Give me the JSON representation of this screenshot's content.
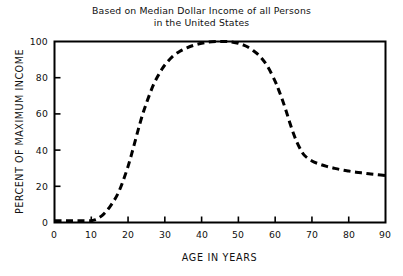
{
  "chart_data": {
    "type": "line",
    "title": "Based on Median Dollar Income of all Persons in the United States",
    "title_lines": [
      "Based on Median Dollar Income of all Persons",
      "in the United States"
    ],
    "xlabel": "AGE IN YEARS",
    "ylabel": "PERCENT OF MAXIMUM INCOME",
    "xlim": [
      0,
      90
    ],
    "ylim": [
      0,
      100
    ],
    "xticks": [
      0,
      10,
      20,
      30,
      40,
      50,
      60,
      70,
      80,
      90
    ],
    "yticks": [
      0,
      20,
      40,
      60,
      80,
      100
    ],
    "xtick_labels": [
      "0",
      "10",
      "20",
      "30",
      "40",
      "50",
      "60",
      "70",
      "80",
      "90"
    ],
    "ytick_labels": [
      "0",
      "20",
      "40",
      "60",
      "80",
      "100"
    ],
    "grid": false,
    "legend": null,
    "line_style": "dashed",
    "line_color": "#000000",
    "frame_color": "#000000",
    "background_color": "#ffffff",
    "series": [
      {
        "name": "Percent of maximum income",
        "x": [
          0,
          2,
          4,
          6,
          8,
          10,
          11,
          12,
          13,
          14,
          15,
          16,
          17,
          18,
          19,
          20,
          21,
          22,
          23,
          24,
          25,
          26,
          27,
          28,
          29,
          30,
          32,
          34,
          36,
          38,
          40,
          42,
          44,
          45,
          46,
          47,
          48,
          50,
          52,
          54,
          56,
          58,
          60,
          61,
          62,
          63,
          64,
          65,
          66,
          67,
          68,
          70,
          72,
          74,
          76,
          78,
          80,
          82,
          84,
          86,
          88,
          90
        ],
        "y": [
          1,
          1,
          1,
          1,
          1,
          1,
          1.5,
          2.5,
          4,
          6,
          8.5,
          11.5,
          15,
          19.5,
          25,
          31,
          38,
          45.5,
          53,
          60,
          66,
          71.5,
          76.5,
          80.5,
          84,
          87,
          91.5,
          94.5,
          96.5,
          98,
          99,
          99.7,
          100,
          100,
          100,
          100,
          99.8,
          99,
          97.5,
          95,
          91.5,
          86,
          78,
          73,
          67.5,
          61.5,
          55,
          49,
          44,
          40,
          37,
          34,
          32.3,
          31,
          30,
          29.1,
          28.4,
          27.8,
          27.3,
          26.8,
          26.4,
          26
        ]
      }
    ]
  }
}
